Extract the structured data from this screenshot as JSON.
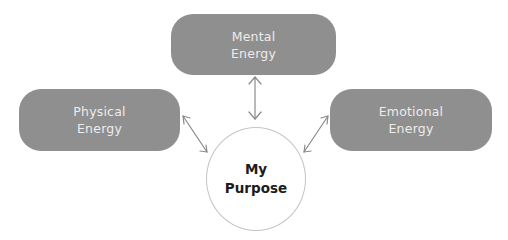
{
  "diagram": {
    "type": "hub-and-spoke",
    "nodes": {
      "mental": {
        "line1": "Mental",
        "line2": "Energy"
      },
      "physical": {
        "line1": "Physical",
        "line2": "Energy"
      },
      "emotional": {
        "line1": "Emotional",
        "line2": "Energy"
      },
      "center": {
        "line1": "My",
        "line2": "Purpose"
      }
    },
    "edges": [
      {
        "from": "Mental Energy",
        "to": "My Purpose",
        "style": "double-arrow"
      },
      {
        "from": "Physical Energy",
        "to": "My Purpose",
        "style": "double-arrow"
      },
      {
        "from": "Emotional Energy",
        "to": "My Purpose",
        "style": "double-arrow"
      }
    ],
    "colors": {
      "box_fill": "#8f8f8f",
      "box_text": "#ececec",
      "circle_border": "#c4c4c4",
      "center_text": "#1c1c1c",
      "arrow": "#8a8a8a"
    }
  }
}
